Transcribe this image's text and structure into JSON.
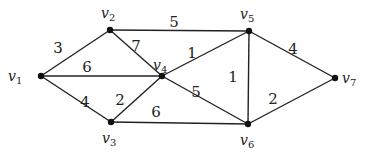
{
  "diagram": {
    "type": "weighted-undirected-graph",
    "nodes": [
      {
        "id": "v1",
        "label": "v",
        "sub": "1",
        "x": 41,
        "y": 76,
        "lx": 8,
        "ly": 81
      },
      {
        "id": "v2",
        "label": "v",
        "sub": "2",
        "x": 110,
        "y": 30,
        "lx": 101,
        "ly": 18
      },
      {
        "id": "v3",
        "label": "v",
        "sub": "3",
        "x": 111,
        "y": 122,
        "lx": 102,
        "ly": 143
      },
      {
        "id": "v4",
        "label": "v",
        "sub": "4",
        "x": 162,
        "y": 76,
        "lx": 153,
        "ly": 70
      },
      {
        "id": "v5",
        "label": "v",
        "sub": "5",
        "x": 249,
        "y": 31,
        "lx": 240,
        "ly": 19
      },
      {
        "id": "v6",
        "label": "v",
        "sub": "6",
        "x": 248,
        "y": 124,
        "lx": 240,
        "ly": 145
      },
      {
        "id": "v7",
        "label": "v",
        "sub": "7",
        "x": 335,
        "y": 78,
        "lx": 342,
        "ly": 83
      }
    ],
    "edges": [
      {
        "from": "v1",
        "to": "v2",
        "weight": "3",
        "wx": 58,
        "wy": 53
      },
      {
        "from": "v1",
        "to": "v4",
        "weight": "6",
        "wx": 87,
        "wy": 72
      },
      {
        "from": "v1",
        "to": "v3",
        "weight": "4",
        "wx": 85,
        "wy": 107
      },
      {
        "from": "v2",
        "to": "v4",
        "weight": "7",
        "wx": 136,
        "wy": 51
      },
      {
        "from": "v2",
        "to": "v5",
        "weight": "5",
        "wx": 174,
        "wy": 27
      },
      {
        "from": "v3",
        "to": "v4",
        "weight": "2",
        "wx": 120,
        "wy": 105
      },
      {
        "from": "v3",
        "to": "v6",
        "weight": "6",
        "wx": 156,
        "wy": 117
      },
      {
        "from": "v4",
        "to": "v5",
        "weight": "1",
        "wx": 192,
        "wy": 58
      },
      {
        "from": "v4",
        "to": "v6",
        "weight": "5",
        "wx": 196,
        "wy": 97
      },
      {
        "from": "v5",
        "to": "v6",
        "weight": "1",
        "wx": 233,
        "wy": 82
      },
      {
        "from": "v5",
        "to": "v7",
        "weight": "4",
        "wx": 293,
        "wy": 54
      },
      {
        "from": "v6",
        "to": "v7",
        "weight": "2",
        "wx": 273,
        "wy": 104
      }
    ]
  }
}
